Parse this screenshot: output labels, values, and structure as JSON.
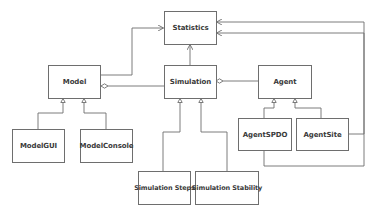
{
  "diagram": {
    "type": "UML class diagram",
    "classes": {
      "statistics": "Statistics",
      "model": "Model",
      "simulation": "Simulation",
      "agent": "Agent",
      "model_gui": "ModelGUI",
      "model_console": "ModelConsole",
      "agent_spdo": "AgentSPDO",
      "agent_site": "AgentSite",
      "simulation_steps": "Simulation Steps",
      "simulation_stability": "Simulation Stability"
    },
    "relationships": [
      {
        "from": "Model",
        "to": "Statistics",
        "kind": "dependency"
      },
      {
        "from": "Simulation",
        "to": "Statistics",
        "kind": "dependency"
      },
      {
        "from": "AgentSite",
        "to": "Statistics",
        "kind": "dependency"
      },
      {
        "from": "AgentSPDO",
        "to": "Statistics",
        "kind": "dependency"
      },
      {
        "from": "Model",
        "to": "Simulation",
        "kind": "aggregation"
      },
      {
        "from": "Simulation",
        "to": "Agent",
        "kind": "aggregation"
      },
      {
        "from": "ModelGUI",
        "to": "Model",
        "kind": "generalization"
      },
      {
        "from": "ModelConsole",
        "to": "Model",
        "kind": "generalization"
      },
      {
        "from": "Simulation Steps",
        "to": "Simulation",
        "kind": "generalization"
      },
      {
        "from": "Simulation Stability",
        "to": "Simulation",
        "kind": "generalization"
      },
      {
        "from": "AgentSPDO",
        "to": "Agent",
        "kind": "generalization"
      },
      {
        "from": "AgentSite",
        "to": "Agent",
        "kind": "generalization"
      }
    ],
    "colors": {
      "line": "#6e6e6e",
      "text": "#3a3a3a",
      "background": "#ffffff"
    }
  }
}
